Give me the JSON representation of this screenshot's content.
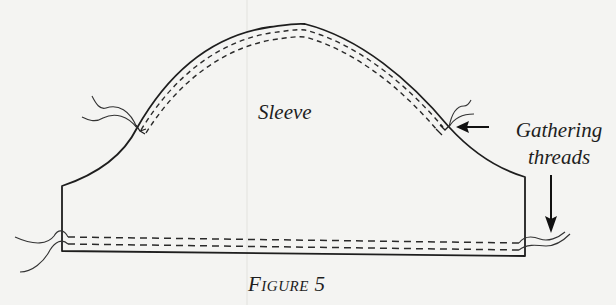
{
  "diagram": {
    "labels": {
      "piece": "Sleeve",
      "callout_line1": "Gathering",
      "callout_line2": "threads"
    },
    "caption": {
      "first_letter": "F",
      "rest": "igure",
      "number": "5"
    },
    "colors": {
      "ink": "#1e1e1e",
      "paper": "#f4f4f2",
      "bleed_through": "#dcdcd8"
    },
    "annotations": [
      {
        "target": "cap-stitching-right-end",
        "arrow": "left",
        "label": "Gathering threads"
      },
      {
        "target": "hem-stitching-right-end",
        "arrow": "down",
        "label": "Gathering threads"
      }
    ]
  }
}
